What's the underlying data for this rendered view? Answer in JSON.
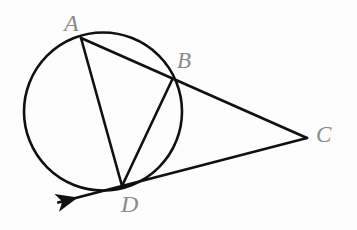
{
  "figure": {
    "background_color": "#fdfdfd",
    "stroke_color": "#101010",
    "label_color": "#8a8a8a",
    "width": 357,
    "height": 230
  },
  "circle": {
    "name": "circle",
    "cx": 103,
    "cy": 111.5,
    "r": 79,
    "stroke_width": 2.6
  },
  "points": {
    "A": {
      "label": "A",
      "x": 81,
      "y": 38,
      "label_x": 64,
      "label_y": 11
    },
    "B": {
      "label": "B",
      "x": 172,
      "y": 80,
      "label_x": 177,
      "label_y": 49
    },
    "C": {
      "label": "C",
      "x": 307,
      "y": 138,
      "label_x": 316,
      "label_y": 123
    },
    "D": {
      "label": "D",
      "x": 122,
      "y": 186,
      "label_x": 121,
      "label_y": 192
    }
  },
  "segments": [
    {
      "name": "segment-AC",
      "from": "A",
      "to": "C",
      "x1": 81,
      "y1": 38,
      "x2": 307,
      "y2": 138,
      "stroke_width": 2.6
    },
    {
      "name": "segment-DC",
      "from": "D",
      "to": "C",
      "x1": 122,
      "y1": 186,
      "x2": 307,
      "y2": 138,
      "stroke_width": 2.6
    },
    {
      "name": "segment-AD",
      "from": "A",
      "to": "D",
      "x1": 81,
      "y1": 38,
      "x2": 122,
      "y2": 186,
      "stroke_width": 2.6
    },
    {
      "name": "segment-BD",
      "from": "B",
      "to": "D",
      "x1": 172,
      "y1": 80,
      "x2": 122,
      "y2": 186,
      "stroke_width": 2.6
    }
  ],
  "tangent_ray": {
    "name": "tangent-ray-from-D",
    "x1": 122,
    "y1": 186,
    "x2": 64,
    "y2": 201,
    "arrow": "arrowhead-left",
    "stroke_width": 2.6
  },
  "chart_data": {
    "type": "diagram",
    "elements": [
      {
        "kind": "circle",
        "center": [
          103,
          111.5
        ],
        "radius": 79
      },
      {
        "kind": "point",
        "label": "A",
        "position": [
          81,
          38
        ],
        "on_circle": true
      },
      {
        "kind": "point",
        "label": "B",
        "position": [
          172,
          80
        ],
        "on_circle": true
      },
      {
        "kind": "point",
        "label": "C",
        "position": [
          307,
          138
        ],
        "on_circle": false
      },
      {
        "kind": "point",
        "label": "D",
        "position": [
          122,
          186
        ],
        "on_circle": true
      },
      {
        "kind": "segment",
        "label": "AC",
        "endpoints": [
          [
            81,
            38
          ],
          [
            307,
            138
          ]
        ],
        "note": "secant through B"
      },
      {
        "kind": "segment",
        "label": "DC",
        "endpoints": [
          [
            122,
            186
          ],
          [
            307,
            138
          ]
        ],
        "note": "tangent at D extended to C"
      },
      {
        "kind": "segment",
        "label": "AD",
        "endpoints": [
          [
            81,
            38
          ],
          [
            122,
            186
          ]
        ],
        "note": "chord"
      },
      {
        "kind": "segment",
        "label": "BD",
        "endpoints": [
          [
            172,
            80
          ],
          [
            122,
            186
          ]
        ],
        "note": "chord"
      },
      {
        "kind": "ray",
        "label": "tangent at D",
        "endpoints": [
          [
            122,
            186
          ],
          [
            64,
            201
          ]
        ],
        "arrowhead": "at far end"
      }
    ]
  }
}
